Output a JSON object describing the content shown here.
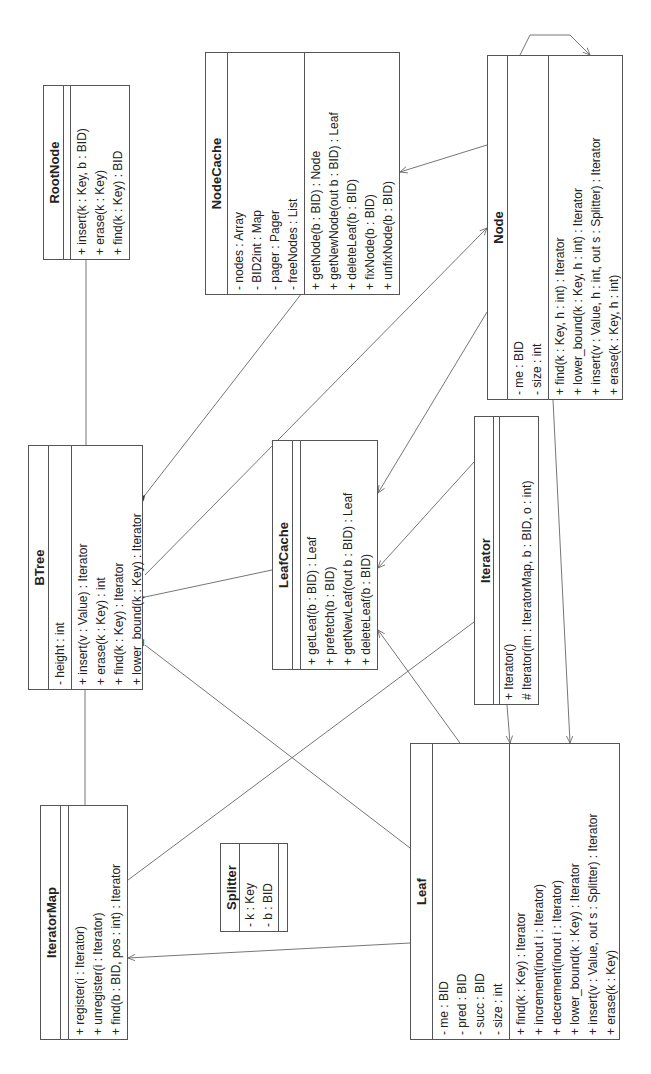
{
  "diagram": {
    "type": "UML class diagram",
    "orientation": "rotated 90 degrees counter-clockwise",
    "line_color": "#666666",
    "box_border_color": "#555555",
    "background": "#ffffff"
  },
  "classes": {
    "rootnode": {
      "name": "RootNode",
      "attributes": [],
      "operations": [
        "+ insert(k : Key, b : BID)",
        "+ erase(k : Key)",
        "+ find(k : Key) : BID"
      ]
    },
    "nodecache": {
      "name": "NodeCache",
      "attributes": [
        "- nodes : Array",
        "- BID2int : Map",
        "- pager : Pager",
        "- freeNodes : List"
      ],
      "operations": [
        "+ getNode(b : BID) : Node",
        "+ getNewNode(out b : BID) : Leaf",
        "+ deleteLeaf(b : BID)",
        "+ fixNode(b : BID)",
        "+ unfixNode(b : BID)"
      ]
    },
    "node": {
      "name": "Node",
      "attributes": [
        "- me : BID",
        "- size : int"
      ],
      "operations": [
        "+ find(k : Key, h : int) : Iterator",
        "+ lower_bound(k : Key, h : int) : Iterator",
        "+ insert(v : Value, h : int, out s : Splitter) : Iterator",
        "+ erase(k : Key, h : int)"
      ]
    },
    "btree": {
      "name": "BTree",
      "attributes": [
        "- height : int"
      ],
      "operations": [
        "+ insert(v : Value) : Iterator",
        "+ erase(k : Key) : int",
        "+ find(k : Key) : Iterator",
        "+ lower_bound(k : Key) : Iterator"
      ]
    },
    "leafcache": {
      "name": "LeafCache",
      "attributes": [],
      "operations": [
        "+ getLeaf(b : BID) : Leaf",
        "+ prefetch(b : BID)",
        "+ getNewLeaf(out b : BID) : Leaf",
        "+ deleteLeaf(b : BID)"
      ]
    },
    "iterator": {
      "name": "Iterator",
      "attributes": [],
      "operations": [
        "+ Iterator()",
        "# Iterator(im : IteratorMap, b : BID, o : int)"
      ]
    },
    "iteratormap": {
      "name": "IteratorMap",
      "attributes": [],
      "operations": [
        "+ register(i : Iterator)",
        "+ unregister(i : Iterator)",
        "+ find(b : BID, pos : int) : Iterator"
      ]
    },
    "splitter": {
      "name": "Splitter",
      "attributes": [
        "- k : Key",
        "- b : BID"
      ],
      "operations": []
    },
    "leaf": {
      "name": "Leaf",
      "attributes": [
        "- me : BID",
        "- pred : BID",
        "- succ : BID",
        "- size : int"
      ],
      "operations": [
        "+ find(k : Key) : Iterator",
        "+ increment(inout i : Iterator)",
        "+ decrement(inout i : Iterator)",
        "+ lower_bound(k : Key) : Iterator",
        "+ insert(v : Value, out s : Splitter) : Iterator",
        "+ erase(k : Key)"
      ]
    }
  },
  "relationships": [
    {
      "from": "BTree",
      "to": "RootNode",
      "kind": "composition"
    },
    {
      "from": "BTree",
      "to": "IteratorMap",
      "kind": "composition"
    },
    {
      "from": "BTree",
      "to": "NodeCache",
      "kind": "composition"
    },
    {
      "from": "BTree",
      "to": "LeafCache",
      "kind": "composition"
    },
    {
      "from": "BTree",
      "to": "Node",
      "kind": "association-navigable"
    },
    {
      "from": "BTree",
      "to": "Leaf",
      "kind": "association"
    },
    {
      "from": "Node",
      "to": "NodeCache",
      "kind": "association-navigable"
    },
    {
      "from": "Node",
      "to": "LeafCache",
      "kind": "association-navigable"
    },
    {
      "from": "Node",
      "to": "Leaf",
      "kind": "association-navigable"
    },
    {
      "from": "Node",
      "to": "Node",
      "kind": "self-association"
    },
    {
      "from": "Iterator",
      "to": "LeafCache",
      "kind": "association-navigable"
    },
    {
      "from": "Iterator",
      "to": "Leaf",
      "kind": "association-navigable"
    },
    {
      "from": "Iterator",
      "to": "IteratorMap",
      "kind": "association"
    },
    {
      "from": "Leaf",
      "to": "LeafCache",
      "kind": "association-navigable"
    },
    {
      "from": "Leaf",
      "to": "IteratorMap",
      "kind": "association-navigable"
    }
  ]
}
